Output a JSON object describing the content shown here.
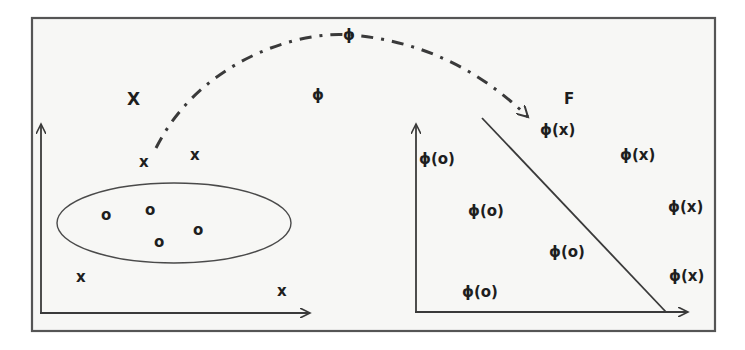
{
  "diagram": {
    "title": "",
    "colors": {
      "stroke": "#3a3a3a",
      "background": "#f7f7f5",
      "text": "#1e1e1e"
    },
    "input_space": {
      "label": "X",
      "x_points": [
        "x",
        "x",
        "x",
        "x"
      ],
      "o_points": [
        "o",
        "o",
        "o",
        "o"
      ],
      "region": "ellipse enclosing o points"
    },
    "mapping": {
      "label_phi_1": "ϕ",
      "label_phi_2": "ϕ",
      "arrow_style": "dashed curved arrow"
    },
    "feature_space": {
      "label": "F",
      "mapped_x": [
        "ϕ(x)",
        "ϕ(x)",
        "ϕ(x)",
        "ϕ(x)"
      ],
      "mapped_o": [
        "ϕ(o)",
        "ϕ(o)",
        "ϕ(o)",
        "ϕ(o)"
      ],
      "separator": "linear decision boundary"
    }
  }
}
